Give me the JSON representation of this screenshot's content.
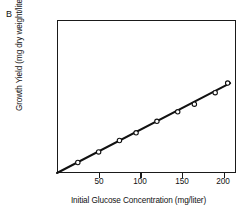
{
  "panel": {
    "label": "B"
  },
  "chart_data": {
    "type": "scatter",
    "title": "",
    "subtitle": "",
    "panel_label": "B",
    "xlabel": "Initial Glucose Concentration (mg/liter)",
    "ylabel": "Growth Yield (mg dry weight/liter)",
    "xlim": [
      0,
      215
    ],
    "ylim": [
      0,
      80
    ],
    "xticks": [
      50,
      100,
      150,
      200
    ],
    "xtick_labels": [
      "50",
      "100",
      "150",
      "200"
    ],
    "yticks": [
      20,
      40,
      60,
      80
    ],
    "ytick_labels": [
      "20",
      "40",
      "60",
      "80"
    ],
    "grid": false,
    "legend": null,
    "legend_position": "none",
    "marker_style": "open-circle",
    "x": [
      25,
      50,
      75,
      95,
      120,
      145,
      165,
      190,
      205
    ],
    "y": [
      5.5,
      11,
      17,
      21,
      27,
      32,
      36,
      42,
      47
    ],
    "series": [
      {
        "name": "Growth yield vs glucose",
        "x": [
          25,
          50,
          75,
          95,
          120,
          145,
          165,
          190,
          205
        ],
        "values": [
          5.5,
          11,
          17,
          21,
          27,
          32,
          36,
          42,
          47
        ]
      }
    ],
    "fit_line": {
      "type": "linear",
      "intercept": 0,
      "slope": 0.225,
      "x_start": 0,
      "x_end": 208,
      "y_start": 0,
      "y_end": 47
    },
    "annotations": []
  }
}
